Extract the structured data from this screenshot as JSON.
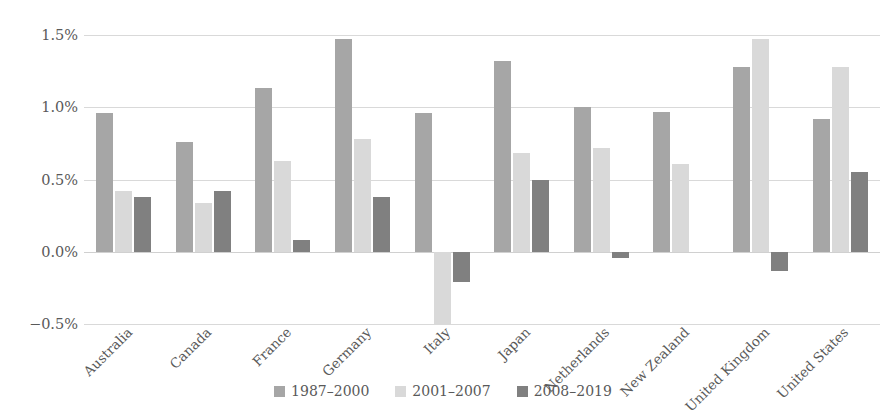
{
  "chart_data": {
    "type": "bar",
    "title": "",
    "subtitle": "",
    "xlabel": "",
    "ylabel": "",
    "grid": true,
    "legend_position": "bottom",
    "ylim": [
      -0.5,
      1.5
    ],
    "ytick_labels": [
      "1.5%",
      "1.0%",
      "0.5%",
      "0.0%",
      "−0.5%"
    ],
    "ytick_values": [
      1.5,
      1.0,
      0.5,
      0.0,
      -0.5
    ],
    "categories": [
      "Australia",
      "Canada",
      "France",
      "Germany",
      "Italy",
      "Japan",
      "Netherlands",
      "New Zealand",
      "United Kingdom",
      "United States"
    ],
    "series": [
      {
        "name": "1987–2000",
        "color": "#a6a6a6",
        "values": [
          0.96,
          0.76,
          1.13,
          1.47,
          0.96,
          1.32,
          1.0,
          0.97,
          1.28,
          0.92
        ]
      },
      {
        "name": "2001–2007",
        "color": "#d9d9d9",
        "values": [
          0.42,
          0.34,
          0.63,
          0.78,
          -0.5,
          0.68,
          0.72,
          0.61,
          1.47,
          1.28
        ]
      },
      {
        "name": "2008–2019",
        "color": "#808080",
        "values": [
          0.38,
          0.42,
          0.08,
          0.38,
          -0.21,
          0.5,
          -0.04,
          null,
          -0.13,
          0.55
        ]
      }
    ]
  },
  "style": {
    "grid_color": "#d9d9d9",
    "text_color": "#595959",
    "background": "#ffffff"
  }
}
